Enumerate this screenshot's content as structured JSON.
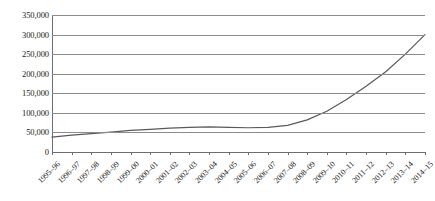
{
  "chart_data": {
    "type": "line",
    "title": "",
    "subtitle": "",
    "xlabel": "",
    "ylabel": "",
    "grid": true,
    "legend": false,
    "legend_position": "none",
    "line_color": "#595959",
    "categories": [
      "1995–96",
      "1996–97",
      "1997–98",
      "1998–99",
      "1999–00",
      "2000–01",
      "2001–02",
      "2002–03",
      "2003–04",
      "2004–05",
      "2005–06",
      "2006–07",
      "2007–08",
      "2008–09",
      "2009–10",
      "2010–11",
      "2011–12",
      "2012–13",
      "2013–14",
      "2014–15"
    ],
    "values": [
      38000,
      43000,
      47000,
      51000,
      55000,
      58000,
      61000,
      63000,
      64000,
      63000,
      62000,
      63000,
      68000,
      82000,
      104000,
      134000,
      168000,
      205000,
      250000,
      300000
    ],
    "ylim": [
      0,
      350000
    ],
    "yticks": [
      0,
      50000,
      100000,
      150000,
      200000,
      250000,
      300000,
      350000
    ],
    "ytick_labels": [
      "0",
      "50,000",
      "100,000",
      "150,000",
      "200,000",
      "250,000",
      "300,000",
      "350,000"
    ]
  }
}
